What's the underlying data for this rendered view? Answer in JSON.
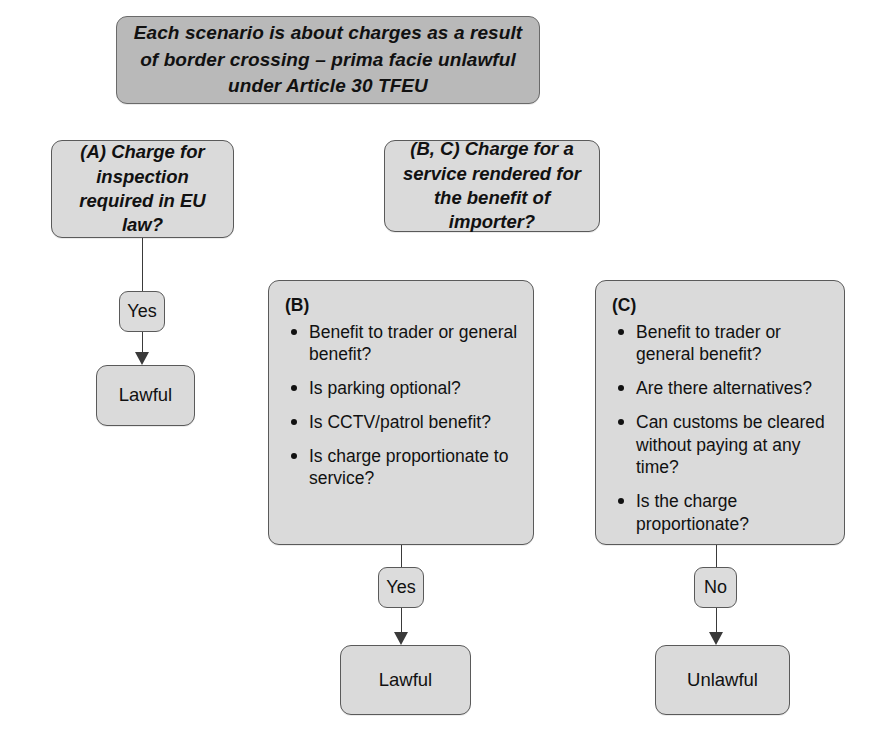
{
  "header": {
    "text": "Each scenario is about charges as a result of border crossing – prima facie unlawful under Article 30 TFEU"
  },
  "nodes": {
    "decision_a": "(A) Charge for inspection required in EU law?",
    "decision_bc": "(B, C) Charge for a service rendered for the benefit of importer?",
    "box_b_label": "(B)",
    "box_b_items": [
      "Benefit to trader or general benefit?",
      "Is parking optional?",
      "Is CCTV/patrol benefit?",
      "Is charge proportionate to service?"
    ],
    "box_c_label": "(C)",
    "box_c_items": [
      "Benefit to trader or general benefit?",
      "Are there alternatives?",
      "Can customs be cleared without paying at any time?",
      "Is the charge proportionate?"
    ]
  },
  "edges": {
    "a_yes": "Yes",
    "b_yes": "Yes",
    "c_no": "No"
  },
  "outcomes": {
    "a_result": "Lawful",
    "b_result": "Lawful",
    "c_result": "Unlawful"
  },
  "colors": {
    "header_fill": "#b9b9b9",
    "box_fill": "#dadada",
    "border": "#5a5a5a",
    "connector": "#3a3a3a",
    "text": "#111111"
  }
}
